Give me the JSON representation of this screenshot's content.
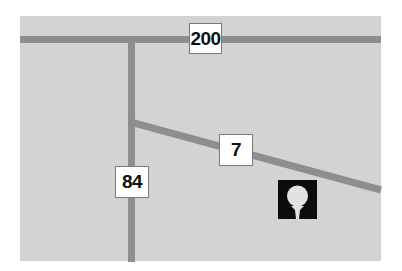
{
  "map": {
    "background_color": "#d3d3d3",
    "road_color": "#8e8e8e",
    "roads": [
      {
        "id": "200",
        "orientation": "horizontal",
        "label": "200"
      },
      {
        "id": "84",
        "orientation": "vertical",
        "label": "84"
      },
      {
        "id": "7",
        "orientation": "diagonal",
        "label": "7"
      }
    ],
    "poi": {
      "icon": "golf-ball-on-tee-icon",
      "type": "golf course"
    }
  }
}
